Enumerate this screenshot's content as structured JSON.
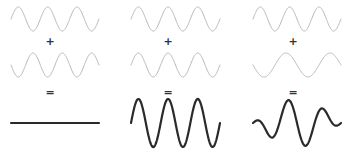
{
  "colors": {
    "input_wave": "#b8b8b8",
    "result_wave": "#2a2a2a",
    "operator": "#333333"
  },
  "operators": {
    "plus": "+",
    "equals": "="
  },
  "panels": [
    {
      "name": "destructive-interference",
      "x0": 11,
      "x1": 99,
      "wave_a": {
        "cycles": 3,
        "amplitude": 12,
        "phase": 0
      },
      "wave_b": {
        "cycles": 3,
        "amplitude": 12,
        "phase": 3.14159
      },
      "result": "flat"
    },
    {
      "name": "constructive-interference",
      "x0": 131,
      "x1": 220,
      "wave_a": {
        "cycles": 3,
        "amplitude": 12,
        "phase": 0
      },
      "wave_b": {
        "cycles": 3,
        "amplitude": 12,
        "phase": 0
      },
      "result": "sum"
    },
    {
      "name": "mixed-frequency-interference",
      "x0": 253,
      "x1": 341,
      "wave_a": {
        "cycles": 3,
        "amplitude": 12,
        "phase": 0
      },
      "wave_b": {
        "cycles": 2,
        "amplitude": 12,
        "phase": 3.14159
      },
      "result": "sum"
    }
  ]
}
